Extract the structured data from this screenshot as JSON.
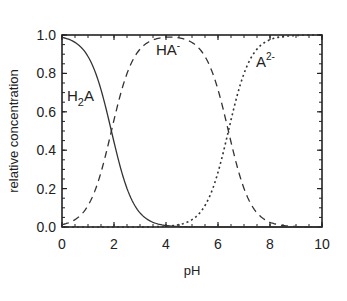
{
  "chart_data": {
    "type": "line",
    "title": "",
    "xlabel": "pH",
    "ylabel": "relative concentration",
    "xlim": [
      0,
      10
    ],
    "ylim": [
      0.0,
      1.0
    ],
    "x_ticks": [
      "0",
      "2",
      "4",
      "6",
      "8",
      "10"
    ],
    "y_ticks": [
      "0.0",
      "0.2",
      "0.4",
      "0.6",
      "0.8",
      "1.0"
    ],
    "grid": false,
    "legend": "inline labels",
    "pKa": [
      1.9,
      6.4
    ],
    "x": [
      0,
      0.5,
      1,
      1.5,
      2,
      2.5,
      3,
      3.5,
      4,
      4.5,
      5,
      5.5,
      6,
      6.5,
      7,
      7.5,
      8,
      8.5,
      9,
      9.5,
      10
    ],
    "series": [
      {
        "name": "H2A",
        "label_main": "H",
        "label_sub": "2",
        "label_tail": "A",
        "style": "solid",
        "values": [
          0.99,
          0.96,
          0.89,
          0.72,
          0.44,
          0.2,
          0.07,
          0.02,
          0.01,
          0.0,
          0.0,
          0.0,
          0.0,
          0.0,
          0.0,
          0.0,
          0.0,
          0.0,
          0.0,
          0.0,
          0.0
        ]
      },
      {
        "name": "HA-",
        "label_main": "HA",
        "label_sup": "-",
        "style": "dashed",
        "values": [
          0.01,
          0.04,
          0.11,
          0.28,
          0.56,
          0.8,
          0.92,
          0.97,
          0.98,
          0.97,
          0.96,
          0.89,
          0.71,
          0.44,
          0.2,
          0.07,
          0.02,
          0.01,
          0.0,
          0.0,
          0.0
        ]
      },
      {
        "name": "A2-",
        "label_main": "A",
        "label_sup": "2-",
        "style": "dotted",
        "values": [
          0.0,
          0.0,
          0.0,
          0.0,
          0.0,
          0.0,
          0.0,
          0.01,
          0.01,
          0.03,
          0.04,
          0.11,
          0.28,
          0.56,
          0.8,
          0.93,
          0.98,
          0.99,
          1.0,
          1.0,
          1.0
        ]
      }
    ]
  }
}
